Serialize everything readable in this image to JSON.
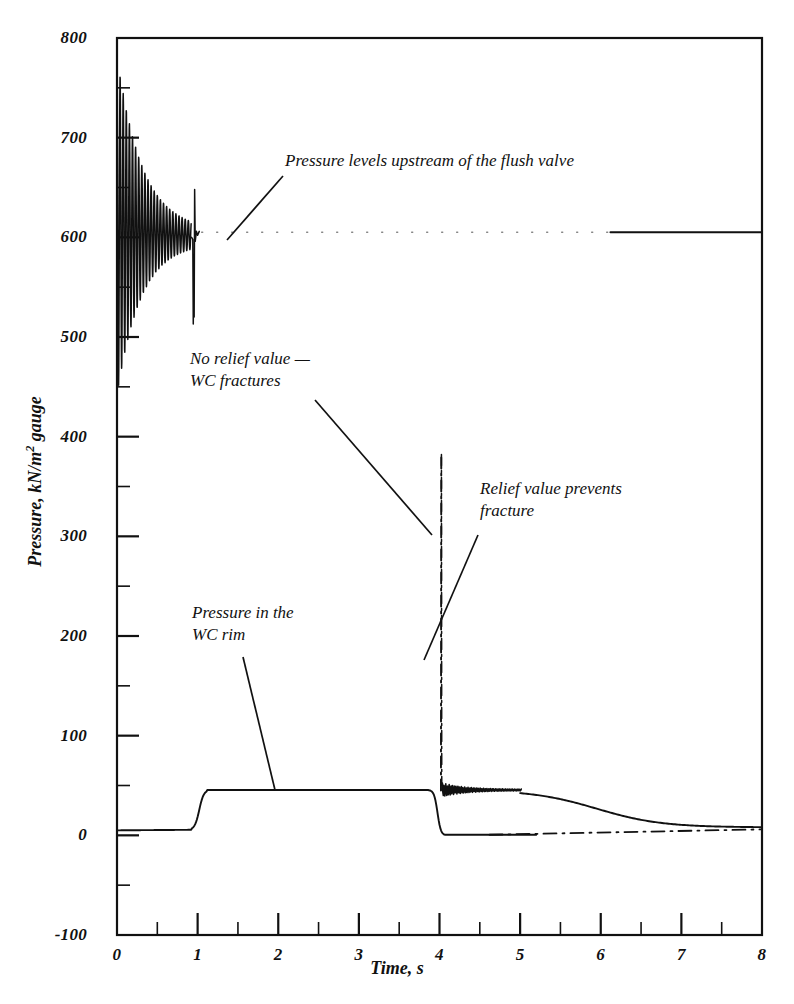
{
  "chart_data": {
    "type": "line",
    "title": "",
    "xlabel": "Time, s",
    "ylabel": "Pressure, kN/m² gauge",
    "ylabel_prefix": "Pressure, kN/m",
    "ylabel_exponent": "2",
    "ylabel_suffix": " gauge",
    "xlim": [
      0,
      8
    ],
    "ylim": [
      -100,
      800
    ],
    "xticks": [
      0,
      1,
      2,
      3,
      4,
      5,
      6,
      7,
      8
    ],
    "xtick_labels": [
      "0",
      "1",
      "2",
      "3",
      "4",
      "5",
      "6",
      "7",
      "8"
    ],
    "xminor_step": 0.5,
    "yticks": [
      -100,
      0,
      100,
      200,
      300,
      400,
      500,
      600,
      700,
      800
    ],
    "ytick_labels": [
      "-100",
      "0",
      "100",
      "200",
      "300",
      "400",
      "500",
      "600",
      "700",
      "800"
    ],
    "yminor_step": 50,
    "grid": false,
    "legend": "none",
    "line_color": "#111111",
    "axis_color": "#111111",
    "background": "#ffffff",
    "series": [
      {
        "name": "Pressure levels upstream of the flush valve",
        "style": "solid-oscillatory-then-dotted",
        "description": "Damped high-frequency oscillation starting at ~750 at t=0, ringing about 600, settling near 600; sharp transient dip to ~510 at t=0.95; faint dotted level near 605 from t=1.1 to t=6.1, then solid line at 605 to t=8",
        "points": [
          [
            0.0,
            600
          ],
          [
            0.02,
            752
          ],
          [
            0.05,
            500
          ],
          [
            0.1,
            715
          ],
          [
            0.15,
            505
          ],
          [
            0.2,
            690
          ],
          [
            0.28,
            520
          ],
          [
            0.35,
            668
          ],
          [
            0.45,
            540
          ],
          [
            0.55,
            648
          ],
          [
            0.65,
            560
          ],
          [
            0.75,
            625
          ],
          [
            0.85,
            585
          ],
          [
            0.9,
            600
          ],
          [
            0.93,
            598
          ],
          [
            0.95,
            512
          ],
          [
            0.97,
            640
          ],
          [
            1.0,
            600
          ],
          [
            1.1,
            605
          ],
          [
            2.0,
            605
          ],
          [
            3.0,
            605
          ],
          [
            4.0,
            605
          ],
          [
            5.0,
            605
          ],
          [
            6.1,
            605
          ],
          [
            7.0,
            605
          ],
          [
            8.0,
            605
          ]
        ]
      },
      {
        "name": "Pressure in the WC rim (no relief valve — WC fractures)",
        "style": "solid",
        "description": "Starts at ~5, rises at t≈1.0 to a plateau of ~45, holds until t≈3.85, drops sharply to ~0 at t≈4.05 and stays at ~0",
        "points": [
          [
            0.0,
            5
          ],
          [
            0.9,
            5
          ],
          [
            0.95,
            8
          ],
          [
            1.0,
            30
          ],
          [
            1.08,
            45
          ],
          [
            2.0,
            45
          ],
          [
            3.0,
            45
          ],
          [
            3.8,
            45
          ],
          [
            3.9,
            42
          ],
          [
            3.98,
            25
          ],
          [
            4.04,
            2
          ],
          [
            4.06,
            0
          ],
          [
            4.5,
            0
          ],
          [
            5.0,
            0
          ],
          [
            5.2,
            0
          ]
        ]
      },
      {
        "name": "Relief valve prevents fracture",
        "style": "dash-dot",
        "description": "Follows the rim pressure to ~45, then a tall narrow spike to ~382 at t≈4.03, returns to ~45 with noisy ringing to t≈5.0, then decays smoothly toward ~8 by t=8",
        "points": [
          [
            4.0,
            45
          ],
          [
            4.02,
            382
          ],
          [
            4.05,
            45
          ],
          [
            4.1,
            52
          ],
          [
            4.2,
            44
          ],
          [
            4.4,
            47
          ],
          [
            4.6,
            45
          ],
          [
            4.8,
            46
          ],
          [
            5.0,
            45
          ],
          [
            5.3,
            42
          ],
          [
            5.6,
            34
          ],
          [
            6.0,
            22
          ],
          [
            6.4,
            15
          ],
          [
            6.8,
            11
          ],
          [
            7.2,
            9
          ],
          [
            7.6,
            8
          ],
          [
            8.0,
            8
          ]
        ]
      }
    ],
    "annotations": [
      {
        "id": "flush-valve",
        "text": "Pressure levels upstream of the flush valve",
        "text_x": 285,
        "text_y": 150,
        "leader_from": [
          283,
          176
        ],
        "leader_to": [
          227,
          240
        ]
      },
      {
        "id": "no-relief-valve",
        "text": "No relief value —\nWC fractures",
        "text_x": 190,
        "text_y": 348,
        "leader_from": [
          315,
          400
        ],
        "leader_to": [
          432,
          535
        ]
      },
      {
        "id": "relief-valve",
        "text": "Relief value prevents\nfracture",
        "text_x": 480,
        "text_y": 478,
        "leader_from": [
          478,
          535
        ],
        "leader_to": [
          424,
          660
        ]
      },
      {
        "id": "wc-rim",
        "text": "Pressure in the\nWC rim",
        "text_x": 192,
        "text_y": 602,
        "leader_from": [
          243,
          657
        ],
        "leader_to": [
          275,
          790
        ]
      }
    ]
  }
}
